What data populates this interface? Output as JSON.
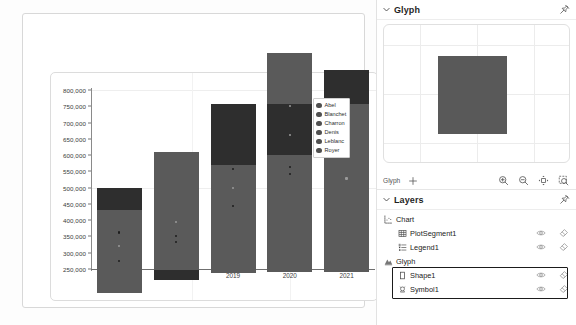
{
  "chart_data": {
    "type": "bar",
    "title": "",
    "xlabel": "",
    "ylabel": "",
    "categories": [
      "2017",
      "2018",
      "2019",
      "2020",
      "2021"
    ],
    "visible_categories": [
      "2019",
      "2020",
      "2021"
    ],
    "values": [
      500000,
      608000,
      757000,
      915000,
      862000
    ],
    "series": [
      {
        "name": "total",
        "values": [
          500000,
          608000,
          757000,
          915000,
          862000
        ]
      }
    ],
    "yticks": [
      "250,000",
      "300,000",
      "350,000",
      "400,000",
      "450,000",
      "500,000",
      "550,000",
      "600,000",
      "650,000",
      "700,000",
      "750,000",
      "800,000"
    ],
    "ytick_values": [
      250000,
      300000,
      350000,
      400000,
      450000,
      500000,
      550000,
      600000,
      650000,
      700000,
      750000,
      800000
    ],
    "ylim": [
      250000,
      800000
    ],
    "grid": true,
    "legend_position": "inside-right",
    "bar_color": "#5a5a5a",
    "segment_color": "#2e2e2e",
    "bars": [
      {
        "category": "2017",
        "top": 500000,
        "bottom": 175000,
        "dark_from": 432000,
        "dark_to": 500000,
        "dots": [
          {
            "value": 362000,
            "shade": "dark"
          },
          {
            "value": 321000,
            "shade": "light"
          },
          {
            "value": 275000,
            "shade": "dark"
          }
        ]
      },
      {
        "category": "2018",
        "top": 608000,
        "bottom": 215000,
        "dark_from": 215000,
        "dark_to": 248000,
        "dots": [
          {
            "value": 352000,
            "shade": "dark"
          },
          {
            "value": 333000,
            "shade": "dark"
          },
          {
            "value": 395000,
            "shade": "light"
          }
        ]
      },
      {
        "category": "2019",
        "top": 757000,
        "bottom": 238000,
        "dark_from": 568000,
        "dark_to": 757000,
        "dots": [
          {
            "value": 556000,
            "shade": "dark"
          },
          {
            "value": 500000,
            "shade": "light"
          },
          {
            "value": 444000,
            "shade": "dark"
          }
        ]
      },
      {
        "category": "2020",
        "top": 915000,
        "bottom": 240000,
        "dark_from": 600000,
        "dark_to": 757000,
        "dots": [
          {
            "value": 750000,
            "shade": "light"
          },
          {
            "value": 662000,
            "shade": "light"
          },
          {
            "value": 563000,
            "shade": "dark"
          },
          {
            "value": 543000,
            "shade": "dark"
          }
        ]
      },
      {
        "category": "2021",
        "top": 862000,
        "bottom": 240000,
        "dark_from": 757000,
        "dark_to": 862000,
        "dots": [
          {
            "value": 700000,
            "shade": "dark"
          },
          {
            "value": 640000,
            "shade": "dark"
          },
          {
            "value": 528000,
            "shade": "light"
          }
        ]
      }
    ],
    "legend": {
      "entries": [
        "Abel",
        "Blanchet",
        "Charron",
        "Denis",
        "Leblanc",
        "Royer"
      ],
      "marker": "circle",
      "marker_color": "#4f4f4f"
    }
  },
  "glyph_panel": {
    "title": "Glyph",
    "collapse_icon": "chevron-down-icon",
    "pin_icon": "pin-icon",
    "shape_fill": "#595959",
    "toolbar": {
      "label": "Glyph",
      "add_label": "+",
      "buttons": [
        {
          "name": "zoom-in-icon",
          "label": "Zoom In"
        },
        {
          "name": "zoom-out-icon",
          "label": "Zoom Out"
        },
        {
          "name": "fit-to-view-icon",
          "label": "Fit"
        },
        {
          "name": "zoom-selection-icon",
          "label": "Zoom to Selection"
        }
      ]
    }
  },
  "layers_panel": {
    "title": "Layers",
    "collapse_icon": "chevron-down-icon",
    "pin_icon": "pin-icon",
    "groups": [
      {
        "name": "Chart",
        "icon": "chart-icon",
        "items": [
          {
            "name": "PlotSegment1",
            "icon": "plot-segment-icon",
            "visible_icon": "eye-icon",
            "clear_icon": "eraser-icon",
            "selected": false
          },
          {
            "name": "Legend1",
            "icon": "legend-icon",
            "visible_icon": "eye-icon",
            "clear_icon": "eraser-icon",
            "selected": false
          }
        ]
      },
      {
        "name": "Glyph",
        "icon": "glyph-icon",
        "items": [
          {
            "name": "Shape1",
            "icon": "shape-rect-icon",
            "visible_icon": "eye-icon",
            "clear_icon": "eraser-icon",
            "selected": true
          },
          {
            "name": "Symbol1",
            "icon": "symbol-icon",
            "visible_icon": "eye-icon",
            "clear_icon": "eraser-icon",
            "selected": true
          }
        ]
      }
    ]
  }
}
